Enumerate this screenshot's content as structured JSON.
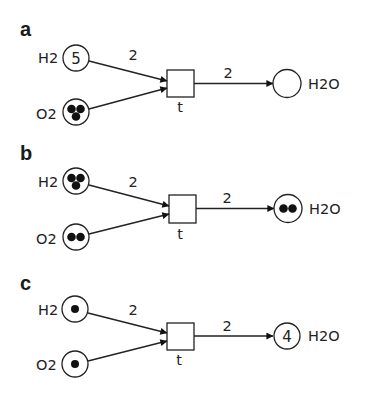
{
  "panels": [
    {
      "label": "a",
      "places": {
        "h2": {
          "name": "H2",
          "tokens": 5,
          "display": "count",
          "text": "5"
        },
        "o2": {
          "name": "O2",
          "tokens": 3,
          "display": "dots"
        },
        "h2o": {
          "name": "H2O",
          "tokens": 0,
          "display": "empty"
        }
      },
      "transition": {
        "name": "t"
      },
      "arcs": {
        "h2_to_t": {
          "weight": "2"
        },
        "o2_to_t": {
          "weight": ""
        },
        "t_to_h2o": {
          "weight": "2"
        }
      }
    },
    {
      "label": "b",
      "places": {
        "h2": {
          "name": "H2",
          "tokens": 3,
          "display": "dots"
        },
        "o2": {
          "name": "O2",
          "tokens": 2,
          "display": "dots"
        },
        "h2o": {
          "name": "H2O",
          "tokens": 2,
          "display": "dots"
        }
      },
      "transition": {
        "name": "t"
      },
      "arcs": {
        "h2_to_t": {
          "weight": "2"
        },
        "o2_to_t": {
          "weight": ""
        },
        "t_to_h2o": {
          "weight": "2"
        }
      }
    },
    {
      "label": "c",
      "places": {
        "h2": {
          "name": "H2",
          "tokens": 1,
          "display": "dots"
        },
        "o2": {
          "name": "O2",
          "tokens": 1,
          "display": "dots"
        },
        "h2o": {
          "name": "H2O",
          "tokens": 4,
          "display": "count",
          "text": "4"
        }
      },
      "transition": {
        "name": "t"
      },
      "arcs": {
        "h2_to_t": {
          "weight": "2"
        },
        "o2_to_t": {
          "weight": ""
        },
        "t_to_h2o": {
          "weight": "2"
        }
      }
    }
  ],
  "colors": {
    "background": "#ffffff",
    "stroke": "#222222",
    "token": "#111111"
  }
}
